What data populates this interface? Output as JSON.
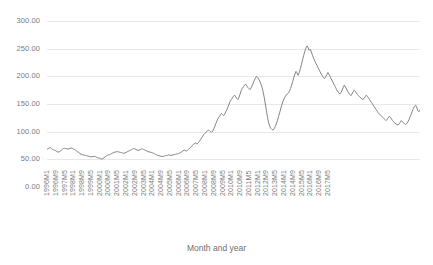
{
  "chart_data": {
    "type": "line",
    "title": "",
    "subtitle": "",
    "xlabel": "Month and year",
    "ylabel": "",
    "ylim": [
      0,
      300
    ],
    "yticks": [
      0,
      50,
      100,
      150,
      200,
      250,
      300
    ],
    "ytick_labels": [
      "0.00",
      "50.00",
      "100.00",
      "150.00",
      "200.00",
      "250.00",
      "300.00"
    ],
    "grid": true,
    "legend": false,
    "legend_position": "none",
    "line_color": "#848484",
    "xtick_labels": [
      "1996M1",
      "1996M9",
      "1997M5",
      "1998M1",
      "1998M9",
      "1999M5",
      "2000M1",
      "2000M9",
      "2001M5",
      "2002M1",
      "2002M9",
      "2003M5",
      "2004M1",
      "2004M9",
      "2005M5",
      "2006M1",
      "2006M9",
      "2007M5",
      "2008M1",
      "2008M9",
      "2009M5",
      "2010M1",
      "2010M9",
      "2011M5",
      "2012M1",
      "2012M9",
      "2013M5",
      "2014M1",
      "2014M9",
      "2015M5",
      "2016M1",
      "2016M9",
      "2017M5"
    ],
    "xtick_step_months": 8,
    "x_start": "1996M1",
    "x_end": "2017M9",
    "series": [
      {
        "name": "Price index",
        "values": [
          68.0,
          69.5,
          70.5,
          71.0,
          69.5,
          68.0,
          67.0,
          66.5,
          65.5,
          64.0,
          63.0,
          63.5,
          64.5,
          66.5,
          68.0,
          69.5,
          70.0,
          69.5,
          69.0,
          68.5,
          69.0,
          70.0,
          70.5,
          70.0,
          69.0,
          68.0,
          66.5,
          65.0,
          63.5,
          62.0,
          60.5,
          59.5,
          58.5,
          58.0,
          57.5,
          57.0,
          56.5,
          56.0,
          55.5,
          55.0,
          54.5,
          54.5,
          55.0,
          55.5,
          55.0,
          54.0,
          53.0,
          52.5,
          52.0,
          51.0,
          50.5,
          51.5,
          53.0,
          54.5,
          56.0,
          57.5,
          58.0,
          58.5,
          59.5,
          60.5,
          61.5,
          62.5,
          63.0,
          63.5,
          64.0,
          63.5,
          63.0,
          62.5,
          62.0,
          61.5,
          61.0,
          61.5,
          62.5,
          63.5,
          64.5,
          65.5,
          66.5,
          67.5,
          68.5,
          69.5,
          69.0,
          68.0,
          67.0,
          66.0,
          66.5,
          67.5,
          68.5,
          69.0,
          68.0,
          67.0,
          66.0,
          65.0,
          64.0,
          63.5,
          63.0,
          62.5,
          62.0,
          61.0,
          60.0,
          59.0,
          58.0,
          57.0,
          56.5,
          56.0,
          55.5,
          55.0,
          55.5,
          56.0,
          56.5,
          57.0,
          57.5,
          58.0,
          57.5,
          57.0,
          57.5,
          58.0,
          58.5,
          59.0,
          59.5,
          60.0,
          60.5,
          61.5,
          62.5,
          64.0,
          65.5,
          67.0,
          66.0,
          65.0,
          66.0,
          68.0,
          70.0,
          72.0,
          74.0,
          76.0,
          78.0,
          80.0,
          79.0,
          78.0,
          80.0,
          83.0,
          86.0,
          89.0,
          92.0,
          95.0,
          97.0,
          99.0,
          101.0,
          103.0,
          102.0,
          100.0,
          99.0,
          101.0,
          105.0,
          110.0,
          115.0,
          120.0,
          124.0,
          127.0,
          130.0,
          133.0,
          131.0,
          129.0,
          132.0,
          136.0,
          140.0,
          145.0,
          150.0,
          155.0,
          158.0,
          161.0,
          164.0,
          166.0,
          163.0,
          160.0,
          158.0,
          162.0,
          168.0,
          174.0,
          178.0,
          181.0,
          184.0,
          186.0,
          183.0,
          180.0,
          178.0,
          176.0,
          179.0,
          183.0,
          188.0,
          193.0,
          197.0,
          200.0,
          198.0,
          195.0,
          191.0,
          186.0,
          180.0,
          172.0,
          162.0,
          150.0,
          138.0,
          126.0,
          116.0,
          110.0,
          106.0,
          104.0,
          103.0,
          105.0,
          109.0,
          114.0,
          120.0,
          127.0,
          134.0,
          141.0,
          148.0,
          154.0,
          159.0,
          163.0,
          166.0,
          168.0,
          170.0,
          173.0,
          178.0,
          184.0,
          191.0,
          198.0,
          204.0,
          209.0,
          206.0,
          202.0,
          207.0,
          214.0,
          222.0,
          230.0,
          238.0,
          245.0,
          251.0,
          255.0,
          252.0,
          247.0,
          249.0,
          244.0,
          238.0,
          233.0,
          228.0,
          224.0,
          220.0,
          216.0,
          212.0,
          208.0,
          204.0,
          201.0,
          198.0,
          196.0,
          199.0,
          203.0,
          207.0,
          204.0,
          200.0,
          196.0,
          192.0,
          188.0,
          184.0,
          180.0,
          176.0,
          173.0,
          170.0,
          168.0,
          171.0,
          175.0,
          180.0,
          184.0,
          181.0,
          177.0,
          173.0,
          170.0,
          167.0,
          165.0,
          168.0,
          172.0,
          175.0,
          173.0,
          170.0,
          167.0,
          165.0,
          163.0,
          161.0,
          159.0,
          158.0,
          160.0,
          163.0,
          166.0,
          164.0,
          161.0,
          158.0,
          155.0,
          152.0,
          149.0,
          146.0,
          143.0,
          140.0,
          137.0,
          134.0,
          132.0,
          130.0,
          128.0,
          126.0,
          124.0,
          122.0,
          120.0,
          122.0,
          125.0,
          128.0,
          126.0,
          123.0,
          120.0,
          118.0,
          116.0,
          114.0,
          113.0,
          112.0,
          114.0,
          117.0,
          120.0,
          118.0,
          116.0,
          114.0,
          113.0,
          115.0,
          118.0,
          122.0,
          127.0,
          132.0,
          137.0,
          142.0,
          146.0,
          148.0,
          144.0,
          138.0,
          136.0,
          139.0
        ]
      }
    ]
  }
}
